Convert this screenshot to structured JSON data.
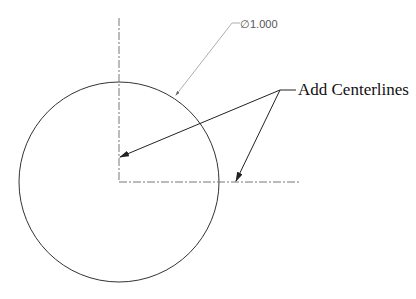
{
  "drawing": {
    "dimension_label": "∅1.000",
    "callout_label": "Add Centerlines",
    "circle": {
      "cx": 119,
      "cy": 182,
      "r": 100
    },
    "colors": {
      "line": "#333333",
      "centerline": "#777777",
      "leader": "#999999"
    }
  }
}
